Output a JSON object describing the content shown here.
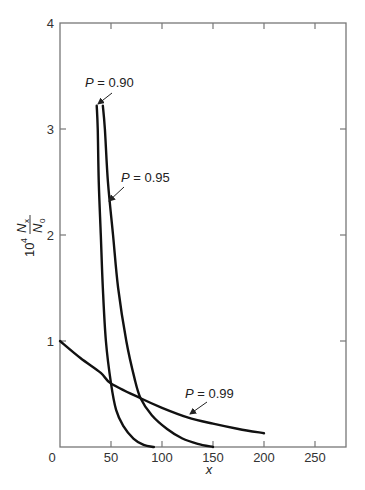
{
  "chart_data": {
    "type": "line",
    "title": "",
    "xlabel": "x",
    "ylabel": "10^4 N_x / N_0",
    "ylabel_parts": {
      "prefix": "10",
      "exponent": "4",
      "numerator": "N",
      "numerator_sub": "x",
      "denominator": "N",
      "denominator_sub": "0"
    },
    "xlim": [
      0,
      280
    ],
    "ylim": [
      0,
      4
    ],
    "x_ticks": [
      0,
      50,
      100,
      150,
      200,
      250
    ],
    "y_ticks": [
      1,
      2,
      3,
      4
    ],
    "x_tick_labels": [
      "0",
      "50",
      "100",
      "150",
      "200",
      "250"
    ],
    "y_tick_labels": [
      "1",
      "2",
      "3",
      "4"
    ],
    "grid": false,
    "legend": "none (inline annotations with arrows)",
    "series": [
      {
        "name": "P = 0.90",
        "annotation": {
          "italic": "P",
          "rest": " = 0.90"
        },
        "x": [
          36,
          37,
          38,
          40,
          42,
          45,
          50,
          55,
          62,
          72,
          82,
          92
        ],
        "y": [
          3.22,
          3.0,
          2.5,
          2.0,
          1.5,
          1.0,
          0.6,
          0.35,
          0.2,
          0.08,
          0.02,
          0.0
        ]
      },
      {
        "name": "P = 0.95",
        "annotation": {
          "italic": "P",
          "rest": " = 0.95"
        },
        "x": [
          42,
          44,
          47,
          52,
          57,
          65,
          73,
          79,
          90,
          105,
          120,
          135,
          150
        ],
        "y": [
          3.22,
          3.0,
          2.5,
          2.0,
          1.5,
          1.0,
          0.65,
          0.46,
          0.3,
          0.17,
          0.08,
          0.03,
          0.0
        ]
      },
      {
        "name": "P = 0.99",
        "annotation": {
          "italic": "P",
          "rest": " = 0.99"
        },
        "x": [
          0,
          20,
          40,
          50,
          79,
          100,
          125,
          150,
          175,
          200
        ],
        "y": [
          1.0,
          0.84,
          0.7,
          0.6,
          0.46,
          0.37,
          0.28,
          0.22,
          0.17,
          0.13
        ]
      }
    ]
  }
}
